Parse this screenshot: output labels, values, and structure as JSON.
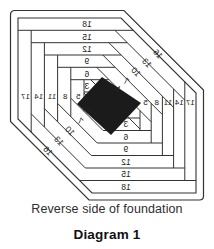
{
  "diagram": {
    "caption": "Reverse side of foundation",
    "title": "Diagram 1",
    "colors": {
      "line": "#333333",
      "patch": "#1b1b1b",
      "background": "#ffffff",
      "text": "#222222"
    },
    "labels": {
      "top": [
        "18",
        "15",
        "12",
        "9",
        "6",
        "3"
      ],
      "bottom": [
        "3",
        "6",
        "9",
        "12",
        "15",
        "18"
      ],
      "left": [
        "17",
        "14",
        "11",
        "8",
        "5"
      ],
      "right": [
        "5",
        "8",
        "11",
        "14",
        "17"
      ],
      "diag_upper_right": [
        "16",
        "13",
        "10",
        "7",
        "4"
      ],
      "diag_lower_left": [
        "4",
        "7",
        "10",
        "13",
        "16"
      ]
    }
  }
}
